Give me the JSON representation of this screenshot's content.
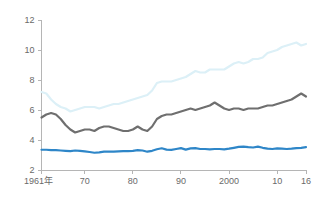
{
  "chart_data": {
    "type": "line",
    "title": "",
    "subtitle": "",
    "xlabel": "",
    "ylabel": "",
    "xlim": [
      1961,
      2016
    ],
    "ylim": [
      2,
      12
    ],
    "grid": false,
    "legend_position": "none",
    "y_ticks": [
      "2",
      "4",
      "6",
      "8",
      "10",
      "12"
    ],
    "y_tick_values": [
      2,
      4,
      6,
      8,
      10,
      12
    ],
    "x_ticks": [
      "1961年",
      "70",
      "80",
      "90",
      "2000",
      "10",
      "16"
    ],
    "x_tick_values": [
      1961,
      1970,
      1980,
      1990,
      2000,
      2010,
      2016
    ],
    "x": [
      1961,
      1962,
      1963,
      1964,
      1965,
      1966,
      1967,
      1968,
      1969,
      1970,
      1971,
      1972,
      1973,
      1974,
      1975,
      1976,
      1977,
      1978,
      1979,
      1980,
      1981,
      1982,
      1983,
      1984,
      1985,
      1986,
      1987,
      1988,
      1989,
      1990,
      1991,
      1992,
      1993,
      1994,
      1995,
      1996,
      1997,
      1998,
      1999,
      2000,
      2001,
      2002,
      2003,
      2004,
      2005,
      2006,
      2007,
      2008,
      2009,
      2010,
      2011,
      2012,
      2013,
      2014,
      2015,
      2016
    ],
    "series": [
      {
        "name": "light-blue-series",
        "color": "#dcf0f7",
        "width": 2.2,
        "values": [
          7.2,
          7.1,
          6.7,
          6.4,
          6.2,
          6.1,
          5.9,
          6.0,
          6.1,
          6.2,
          6.2,
          6.2,
          6.1,
          6.2,
          6.3,
          6.4,
          6.4,
          6.5,
          6.6,
          6.7,
          6.8,
          6.9,
          7.0,
          7.3,
          7.8,
          7.9,
          7.9,
          7.9,
          8.0,
          8.1,
          8.2,
          8.4,
          8.6,
          8.5,
          8.5,
          8.7,
          8.7,
          8.7,
          8.7,
          8.9,
          9.1,
          9.2,
          9.1,
          9.2,
          9.4,
          9.4,
          9.5,
          9.8,
          9.9,
          10.0,
          10.2,
          10.3,
          10.4,
          10.5,
          10.3,
          10.4
        ]
      },
      {
        "name": "dark-gray-series",
        "color": "#6f6f6f",
        "width": 2.2,
        "values": [
          5.5,
          5.7,
          5.8,
          5.7,
          5.4,
          5.0,
          4.7,
          4.5,
          4.6,
          4.7,
          4.7,
          4.6,
          4.8,
          4.9,
          4.9,
          4.8,
          4.7,
          4.6,
          4.6,
          4.7,
          4.9,
          4.7,
          4.6,
          4.9,
          5.4,
          5.6,
          5.7,
          5.7,
          5.8,
          5.9,
          6.0,
          6.1,
          6.0,
          6.1,
          6.2,
          6.3,
          6.5,
          6.3,
          6.1,
          6.0,
          6.1,
          6.1,
          6.0,
          6.1,
          6.1,
          6.1,
          6.2,
          6.3,
          6.3,
          6.4,
          6.5,
          6.6,
          6.7,
          6.9,
          7.1,
          6.9
        ]
      },
      {
        "name": "blue-series",
        "color": "#2e86c8",
        "width": 2.2,
        "values": [
          3.35,
          3.35,
          3.33,
          3.32,
          3.3,
          3.28,
          3.26,
          3.3,
          3.28,
          3.24,
          3.2,
          3.15,
          3.18,
          3.22,
          3.22,
          3.22,
          3.24,
          3.26,
          3.26,
          3.28,
          3.32,
          3.3,
          3.22,
          3.28,
          3.38,
          3.45,
          3.36,
          3.34,
          3.4,
          3.46,
          3.36,
          3.44,
          3.46,
          3.4,
          3.4,
          3.38,
          3.4,
          3.4,
          3.38,
          3.42,
          3.48,
          3.54,
          3.56,
          3.52,
          3.5,
          3.56,
          3.48,
          3.42,
          3.4,
          3.44,
          3.42,
          3.4,
          3.42,
          3.46,
          3.48,
          3.52
        ]
      }
    ]
  }
}
